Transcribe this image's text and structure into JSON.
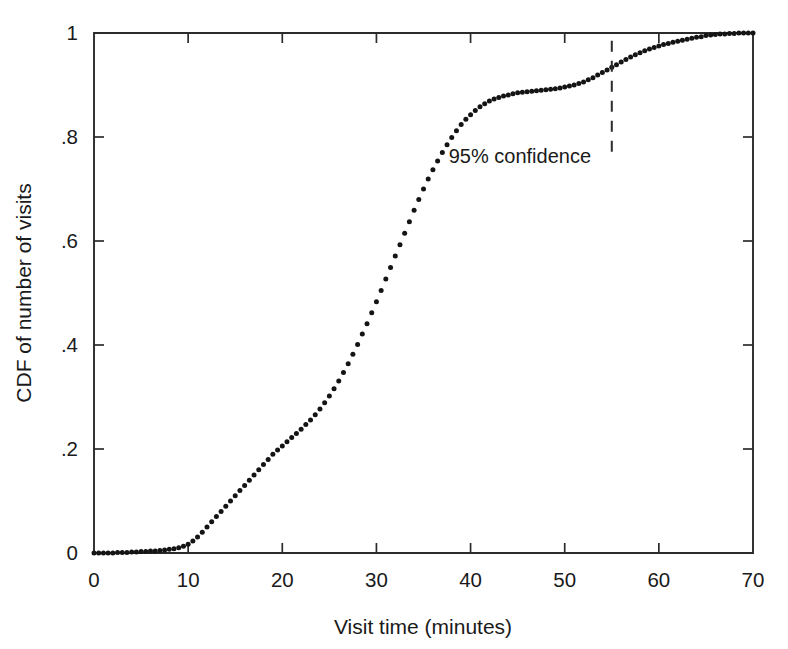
{
  "chart_data": {
    "type": "scatter",
    "title": "",
    "subtitle": "",
    "xlabel": "Visit time (minutes)",
    "ylabel": "CDF of number of visits",
    "xlim": [
      0,
      70
    ],
    "ylim": [
      0,
      1
    ],
    "grid": false,
    "legend": null,
    "legend_position": "none",
    "marker_style": "dot",
    "series_name": "CDF of number of visits",
    "xticks": [
      0,
      10,
      20,
      30,
      40,
      50,
      60,
      70
    ],
    "xticklabels": [
      "0",
      "10",
      "20",
      "30",
      "40",
      "50",
      "60",
      "70"
    ],
    "yticks": [
      0,
      0.2,
      0.4,
      0.6,
      0.8,
      1
    ],
    "yticklabels": [
      "0",
      ".2",
      ".4",
      ".6",
      ".8",
      "1"
    ],
    "annotations": [
      {
        "name": "confidence-marker",
        "text": "95% confidence",
        "x": 55,
        "line_style": "dashed",
        "line_from_y": 0.985,
        "line_to_y": 0.76,
        "text_x": 52.8,
        "text_y": 0.75,
        "text_anchor": "end"
      }
    ],
    "x": [
      0,
      0.5,
      1,
      1.5,
      2,
      2.5,
      3,
      3.5,
      4,
      4.5,
      5,
      5.5,
      6,
      6.5,
      7,
      7.5,
      8,
      8.5,
      9,
      9.5,
      10,
      10.5,
      11,
      11.5,
      12,
      12.5,
      13,
      13.5,
      14,
      14.5,
      15,
      15.5,
      16,
      16.5,
      17,
      17.5,
      18,
      18.5,
      19,
      19.5,
      20,
      20.5,
      21,
      21.5,
      22,
      22.5,
      23,
      23.5,
      24,
      24.5,
      25,
      25.5,
      26,
      26.5,
      27,
      27.5,
      28,
      28.5,
      29,
      29.5,
      30,
      30.5,
      31,
      31.5,
      32,
      32.5,
      33,
      33.5,
      34,
      34.5,
      35,
      35.5,
      36,
      36.5,
      37,
      37.5,
      38,
      38.5,
      39,
      39.5,
      40,
      40.5,
      41,
      41.5,
      42,
      42.5,
      43,
      43.5,
      44,
      44.5,
      45,
      45.5,
      46,
      46.5,
      47,
      47.5,
      48,
      48.5,
      49,
      49.5,
      50,
      50.5,
      51,
      51.5,
      52,
      52.5,
      53,
      53.5,
      54,
      54.5,
      55,
      55.5,
      56,
      56.5,
      57,
      57.5,
      58,
      58.5,
      59,
      59.5,
      60,
      60.5,
      61,
      61.5,
      62,
      62.5,
      63,
      63.5,
      64,
      64.5,
      65,
      65.5,
      66,
      66.5,
      67,
      67.5,
      68,
      68.5,
      69,
      69.5,
      70
    ],
    "y": [
      0.0,
      0.0,
      0.0,
      0.0,
      0.0,
      0.001,
      0.001,
      0.001,
      0.002,
      0.002,
      0.003,
      0.003,
      0.004,
      0.004,
      0.005,
      0.006,
      0.007,
      0.008,
      0.01,
      0.013,
      0.017,
      0.023,
      0.031,
      0.04,
      0.05,
      0.06,
      0.07,
      0.08,
      0.09,
      0.1,
      0.11,
      0.12,
      0.13,
      0.14,
      0.15,
      0.16,
      0.17,
      0.18,
      0.19,
      0.198,
      0.206,
      0.214,
      0.222,
      0.23,
      0.238,
      0.247,
      0.256,
      0.266,
      0.277,
      0.289,
      0.302,
      0.316,
      0.331,
      0.347,
      0.364,
      0.382,
      0.401,
      0.421,
      0.441,
      0.462,
      0.483,
      0.505,
      0.527,
      0.549,
      0.571,
      0.593,
      0.615,
      0.637,
      0.659,
      0.68,
      0.7,
      0.719,
      0.737,
      0.754,
      0.77,
      0.785,
      0.799,
      0.812,
      0.824,
      0.834,
      0.843,
      0.851,
      0.858,
      0.864,
      0.869,
      0.873,
      0.876,
      0.879,
      0.881,
      0.883,
      0.885,
      0.886,
      0.887,
      0.888,
      0.889,
      0.89,
      0.891,
      0.892,
      0.893,
      0.894,
      0.896,
      0.898,
      0.9,
      0.903,
      0.906,
      0.91,
      0.914,
      0.919,
      0.924,
      0.929,
      0.934,
      0.939,
      0.944,
      0.949,
      0.954,
      0.958,
      0.962,
      0.966,
      0.969,
      0.972,
      0.975,
      0.978,
      0.98,
      0.982,
      0.984,
      0.986,
      0.988,
      0.99,
      0.992,
      0.993,
      0.995,
      0.996,
      0.997,
      0.998,
      0.998,
      0.999,
      0.999,
      1.0,
      1.0,
      1.0,
      1.0,
      1.0,
      1.0,
      1.0,
      1.0
    ]
  },
  "figure": {
    "background_color": "#ffffff",
    "marker_color": "#141414",
    "axis_color": "#2b2b2b"
  }
}
